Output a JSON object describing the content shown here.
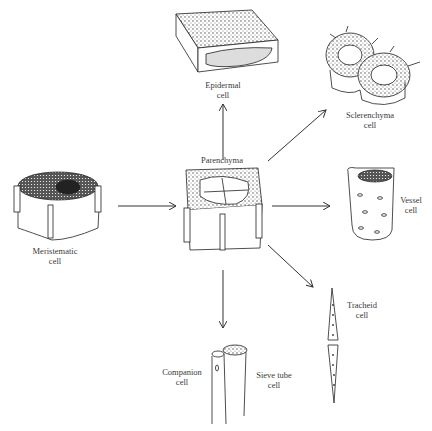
{
  "diagram": {
    "center": {
      "label": "Parenchyma"
    },
    "nodes": [
      {
        "id": "meristematic",
        "label_line1": "Meristematic",
        "label_line2": "cell"
      },
      {
        "id": "epidermal",
        "label_line1": "Epidermal",
        "label_line2": "cell"
      },
      {
        "id": "sclerenchyma",
        "label_line1": "Sclerenchyma",
        "label_line2": "cell"
      },
      {
        "id": "vessel",
        "label_line1": "Vessel",
        "label_line2": "cell"
      },
      {
        "id": "tracheid",
        "label_line1": "Tracheid",
        "label_line2": "cell"
      },
      {
        "id": "companion",
        "label_line1": "Companion",
        "label_line2": "cell"
      },
      {
        "id": "sieve-tube",
        "label_line1": "Sieve tube",
        "label_line2": "cell"
      }
    ],
    "edges": [
      {
        "from": "meristematic",
        "to": "parenchyma"
      },
      {
        "from": "parenchyma",
        "to": "epidermal"
      },
      {
        "from": "parenchyma",
        "to": "sclerenchyma"
      },
      {
        "from": "parenchyma",
        "to": "vessel"
      },
      {
        "from": "parenchyma",
        "to": "tracheid"
      },
      {
        "from": "parenchyma",
        "to": "sieve-tube-companion"
      }
    ]
  }
}
